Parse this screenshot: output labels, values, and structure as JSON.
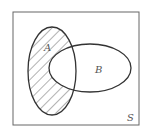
{
  "diagram": {
    "type": "venn",
    "universe_label": "S",
    "sets": [
      {
        "label": "A"
      },
      {
        "label": "B"
      }
    ],
    "shaded_region": "A minus B",
    "colors": {
      "stroke": "#333333",
      "hatch": "#555555",
      "background": "#ffffff"
    }
  }
}
